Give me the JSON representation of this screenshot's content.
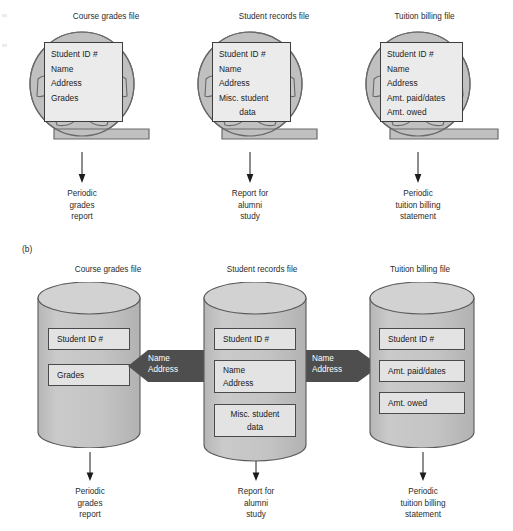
{
  "figure": {
    "section_b_label": "(b)"
  },
  "traditional": {
    "files": [
      {
        "title": "Course grades file",
        "icon": "tape-reel-icon",
        "fields": [
          "Student ID #",
          "Name",
          "Address",
          "Grades"
        ],
        "output": [
          "Periodic",
          "grades",
          "report"
        ]
      },
      {
        "title": "Student records file",
        "icon": "tape-reel-icon",
        "fields": [
          "Student ID #",
          "Name",
          "Address",
          "Misc. student",
          "data"
        ],
        "output": [
          "Report for",
          "alumni",
          "study"
        ]
      },
      {
        "title": "Tuition billing file",
        "icon": "tape-reel-icon",
        "fields": [
          "Student ID #",
          "Name",
          "Address",
          "Amt. paid/dates",
          "Amt. owed"
        ],
        "output": [
          "Periodic",
          "tuition billing",
          "statement"
        ]
      }
    ]
  },
  "database": {
    "files": [
      {
        "title": "Course grades file",
        "icon": "cylinder-database-icon",
        "boxes": [
          [
            "Student ID #"
          ],
          [
            "Grades"
          ]
        ],
        "output": [
          "Periodic",
          "grades",
          "report"
        ]
      },
      {
        "title": "Student records file",
        "icon": "cylinder-database-icon",
        "boxes": [
          [
            "Student ID #"
          ],
          [
            "Name",
            "Address"
          ],
          [
            "Misc. student",
            "data"
          ]
        ],
        "output": [
          "Report for",
          "alumni",
          "study"
        ]
      },
      {
        "title": "Tuition billing file",
        "icon": "cylinder-database-icon",
        "boxes": [
          [
            "Student ID #"
          ],
          [
            "Amt. paid/dates"
          ],
          [
            "Amt. owed"
          ]
        ],
        "output": [
          "Periodic",
          "tuition billing",
          "statement"
        ]
      }
    ],
    "shared_arrows": [
      {
        "direction": "left",
        "lines": [
          "Name",
          "Address"
        ]
      },
      {
        "direction": "right",
        "lines": [
          "Name",
          "Address"
        ]
      }
    ]
  },
  "colors": {
    "reel_fill": "#c0c0c0",
    "reel_stroke": "#6a6a6a",
    "field_fill": "#ebebeb",
    "field_stroke": "#3d3d3d",
    "cylinder_fill": "#c6c6c6",
    "cylinder_top": "#d2d2d2",
    "cylinder_stroke": "#5a5a5a",
    "dbox_fill": "#e3e3e3",
    "dbox_stroke": "#4a4a4a",
    "arrow_fill": "#4e4e4e",
    "text": "#1c1c1c"
  }
}
